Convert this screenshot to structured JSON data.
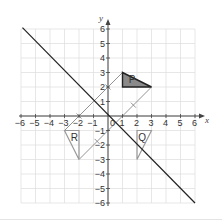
{
  "diagram": {
    "type": "coordinate-grid-transformations",
    "axes": {
      "x_label": "x",
      "y_label": "y",
      "x_range": [
        -6,
        6
      ],
      "y_range": [
        -6,
        6
      ],
      "x_ticks": [
        "-6",
        "-5",
        "-4",
        "-3",
        "-2",
        "-1",
        "0",
        "1",
        "2",
        "3",
        "4",
        "5",
        "6"
      ],
      "y_ticks": [
        "6",
        "5",
        "4",
        "3",
        "2",
        "1",
        "-1",
        "-2",
        "-3",
        "-4",
        "-5",
        "-6"
      ]
    },
    "shapes": [
      {
        "label": "P",
        "vertices": [
          [
            1,
            3
          ],
          [
            1,
            2
          ],
          [
            3,
            2
          ]
        ],
        "fill": "#8a8a8a",
        "stroke": "#222222"
      },
      {
        "label": "Q",
        "vertices": [
          [
            2,
            -1
          ],
          [
            3,
            -1
          ],
          [
            2,
            -3
          ]
        ],
        "fill": "none",
        "stroke": "#9a9a9a"
      },
      {
        "label": "R",
        "vertices": [
          [
            -3,
            -1
          ],
          [
            -2,
            -1
          ],
          [
            -2,
            -3
          ]
        ],
        "fill": "none",
        "stroke": "#9a9a9a"
      }
    ],
    "mirror_line": {
      "from": [
        -5.9,
        6.1
      ],
      "to": [
        6,
        -6
      ],
      "stroke": "#222222"
    },
    "construction_lines": [
      {
        "from": [
          1,
          3
        ],
        "to": [
          -3,
          -1
        ]
      },
      {
        "from": [
          3,
          2
        ],
        "to": [
          -2,
          -3
        ]
      }
    ],
    "colors": {
      "grid": "#dcdcdc",
      "axis": "#444444",
      "construction": "#777777"
    }
  }
}
